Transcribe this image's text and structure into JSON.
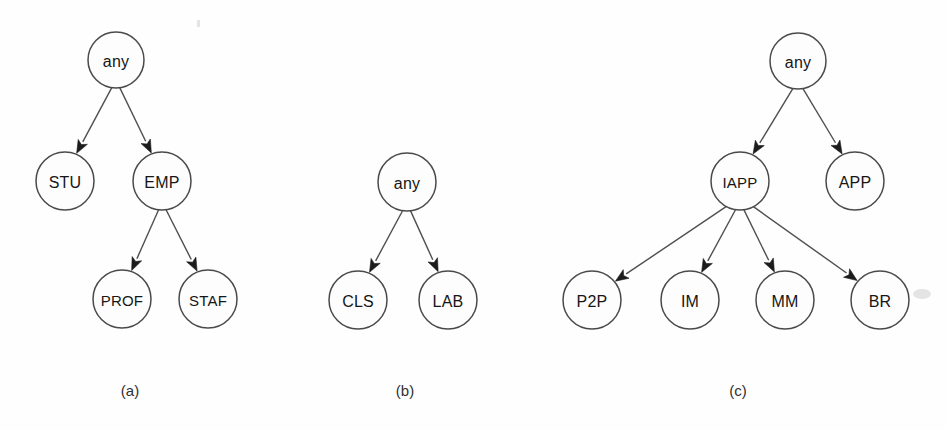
{
  "figure": {
    "background_color": "#fefefe",
    "node_fill": "#fdfdfd",
    "node_stroke": "#4a4a4a",
    "edge_color": "#4f4f4f",
    "arrow_color": "#1c1c1c",
    "node_radius": 29
  },
  "panels": [
    {
      "id": "panel-a",
      "caption": "(a)",
      "caption_pos": {
        "x": 130,
        "y": 390
      },
      "nodes": [
        {
          "id": "a-any",
          "label": "any",
          "x": 116,
          "y": 60,
          "r": 28
        },
        {
          "id": "a-stu",
          "label": "STU",
          "x": 65,
          "y": 181,
          "r": 29
        },
        {
          "id": "a-emp",
          "label": "EMP",
          "x": 162,
          "y": 181,
          "r": 29
        },
        {
          "id": "a-prof",
          "label": "PROF",
          "x": 122,
          "y": 299,
          "r": 29
        },
        {
          "id": "a-staf",
          "label": "STAF",
          "x": 208,
          "y": 299,
          "r": 29
        }
      ],
      "edges": [
        {
          "from": "a-any",
          "to": "a-stu"
        },
        {
          "from": "a-any",
          "to": "a-emp"
        },
        {
          "from": "a-emp",
          "to": "a-prof"
        },
        {
          "from": "a-emp",
          "to": "a-staf"
        }
      ]
    },
    {
      "id": "panel-b",
      "caption": "(b)",
      "caption_pos": {
        "x": 405,
        "y": 390
      },
      "nodes": [
        {
          "id": "b-any",
          "label": "any",
          "x": 407,
          "y": 182,
          "r": 29
        },
        {
          "id": "b-cls",
          "label": "CLS",
          "x": 358,
          "y": 300,
          "r": 29
        },
        {
          "id": "b-lab",
          "label": "LAB",
          "x": 448,
          "y": 300,
          "r": 29
        }
      ],
      "edges": [
        {
          "from": "b-any",
          "to": "b-cls"
        },
        {
          "from": "b-any",
          "to": "b-lab"
        }
      ]
    },
    {
      "id": "panel-c",
      "caption": "(c)",
      "caption_pos": {
        "x": 738,
        "y": 390
      },
      "nodes": [
        {
          "id": "c-any",
          "label": "any",
          "x": 798,
          "y": 61,
          "r": 28
        },
        {
          "id": "c-iapp",
          "label": "IAPP",
          "x": 740,
          "y": 181,
          "r": 29
        },
        {
          "id": "c-app",
          "label": "APP",
          "x": 855,
          "y": 181,
          "r": 29
        },
        {
          "id": "c-p2p",
          "label": "P2P",
          "x": 592,
          "y": 300,
          "r": 29
        },
        {
          "id": "c-im",
          "label": "IM",
          "x": 690,
          "y": 300,
          "r": 29
        },
        {
          "id": "c-mm",
          "label": "MM",
          "x": 785,
          "y": 300,
          "r": 29
        },
        {
          "id": "c-br",
          "label": "BR",
          "x": 880,
          "y": 300,
          "r": 29
        }
      ],
      "edges": [
        {
          "from": "c-any",
          "to": "c-iapp"
        },
        {
          "from": "c-any",
          "to": "c-app"
        },
        {
          "from": "c-iapp",
          "to": "c-p2p"
        },
        {
          "from": "c-iapp",
          "to": "c-im"
        },
        {
          "from": "c-iapp",
          "to": "c-mm"
        },
        {
          "from": "c-iapp",
          "to": "c-br"
        }
      ]
    }
  ]
}
